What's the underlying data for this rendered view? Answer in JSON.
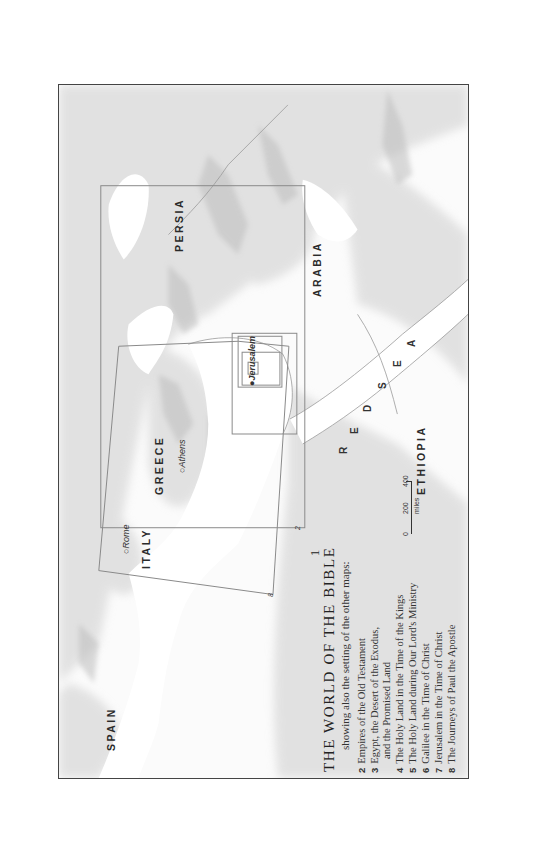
{
  "map": {
    "number": "1",
    "title": "THE WORLD OF THE BIBLE",
    "subtitle": "showing also the setting of the other maps:",
    "legend": [
      {
        "num": "2",
        "text": "Empires of the Old Testament"
      },
      {
        "num": "3",
        "text": "Egypt, the Desert of the Exodus,"
      },
      {
        "num": "",
        "text": "and the Promised Land"
      },
      {
        "num": "4",
        "text": "The Holy Land in the Time of the Kings"
      },
      {
        "num": "5",
        "text": "The Holy Land during Our Lord's Ministry"
      },
      {
        "num": "6",
        "text": "Galilee in the Time of Christ"
      },
      {
        "num": "7",
        "text": "Jerusalem in the Time of Christ"
      },
      {
        "num": "8",
        "text": "The Journeys of Paul the Apostle"
      }
    ],
    "regions": {
      "spain": "SPAIN",
      "italy": "ITALY",
      "greece": "GREECE",
      "persia": "PERSIA",
      "arabia": "ARABIA",
      "ethiopia": "ETHIOPIA",
      "red_sea": [
        "R",
        "E",
        "D",
        "S",
        "E",
        "A"
      ]
    },
    "cities": {
      "rome": "Rome",
      "athens": "Athens",
      "jerusalem": "Jerusalem"
    },
    "inset_labels": {
      "map2": "2",
      "map8": "8"
    },
    "scale": {
      "ticks": [
        "0",
        "200",
        "400"
      ],
      "unit": "miles"
    }
  }
}
